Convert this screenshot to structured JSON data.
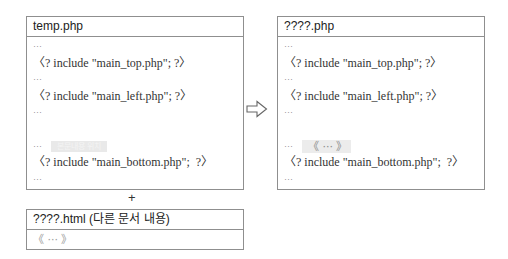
{
  "left_panel": {
    "title": "temp.php",
    "lines": [
      "···",
      "〈? include \"main_top.php\"; ?〉",
      "···",
      "〈? include \"main_left.php\"; ?〉",
      "···",
      "",
      "···",
      "〈? include \"main_bottom.php\";  ?〉",
      "···"
    ],
    "placeholder_text": "본문내용 위치"
  },
  "right_panel": {
    "title": "????.php",
    "lines": [
      "···",
      "〈? include \"main_top.php\"; ?〉",
      "···",
      "〈? include \"main_left.php\"; ?〉",
      "···",
      "《 ··· 》",
      "···",
      "〈? include \"main_bottom.php\";  ?〉",
      "···"
    ]
  },
  "bottom_panel": {
    "title": "????.html (다른 문서 내용)",
    "content": "《 ··· 》"
  },
  "connectors": {
    "plus": "+",
    "arrow_icon": "outlined-right-arrow"
  }
}
